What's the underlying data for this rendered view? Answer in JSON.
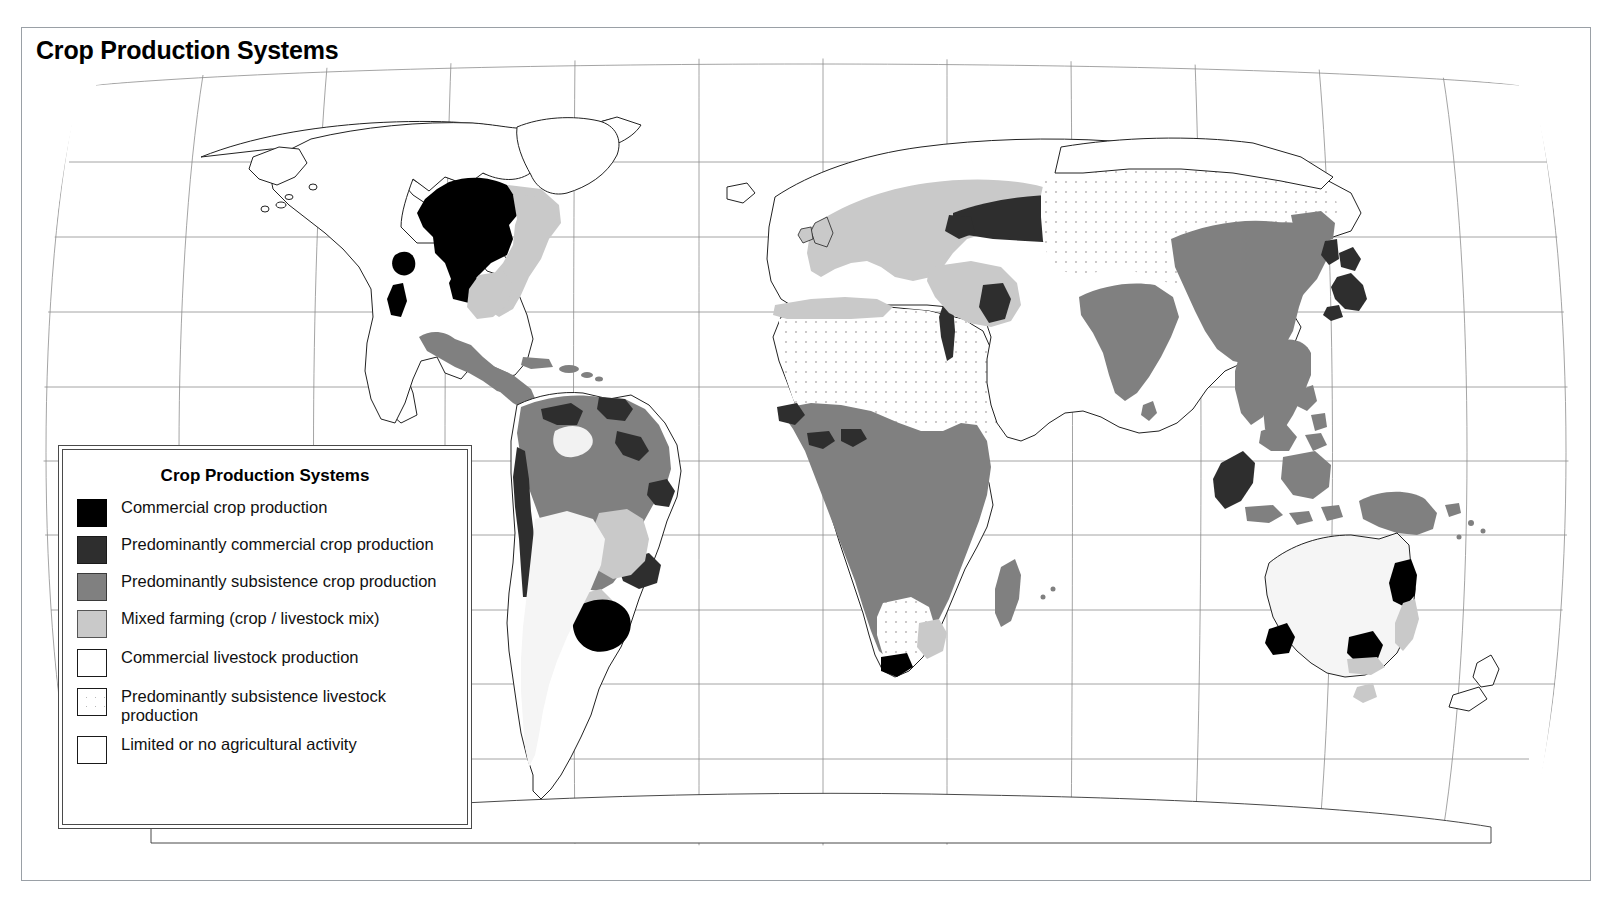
{
  "page": {
    "title": "Crop Production Systems"
  },
  "legend": {
    "title": "Crop Production Systems",
    "items": [
      {
        "swatch": "black",
        "color": "#000000",
        "label": "Commercial crop production"
      },
      {
        "swatch": "darkgray",
        "color": "#2e2e2e",
        "label": "Predominantly commercial crop production"
      },
      {
        "swatch": "midgray",
        "color": "#808080",
        "label": "Predominantly subsistence crop production"
      },
      {
        "swatch": "ltgray",
        "color": "#c9c9c9",
        "label": "Mixed farming  (crop / livestock mix)"
      },
      {
        "swatch": "white",
        "color": "#ffffff",
        "label": "Commercial livestock production"
      },
      {
        "swatch": "stipple",
        "color": "#ffffff",
        "label": "Predominantly subsistence livestock production"
      },
      {
        "swatch": "white",
        "color": "#ffffff",
        "label": "Limited or no agricultural activity"
      }
    ]
  },
  "map_data": {
    "type": "choropleth-world-map",
    "projection": "Robinson",
    "graticule": {
      "meridian_spacing_deg": 30,
      "parallel_spacing_deg": 20,
      "line_color": "#888888"
    },
    "categories": [
      "Commercial crop production",
      "Predominantly commercial crop production",
      "Predominantly subsistence crop production",
      "Mixed farming  (crop / livestock mix)",
      "Commercial livestock production",
      "Predominantly subsistence livestock production",
      "Limited or no agricultural activity"
    ],
    "regions": [
      {
        "name": "US Corn Belt / Canadian Prairies",
        "category": "Commercial crop production"
      },
      {
        "name": "California Central Valley",
        "category": "Commercial crop production"
      },
      {
        "name": "Pampas (Argentina / Uruguay)",
        "category": "Commercial crop production"
      },
      {
        "name": "South Africa Cape / Highveld",
        "category": "Commercial crop production"
      },
      {
        "name": "SE Australia / SW Australia",
        "category": "Commercial crop production"
      },
      {
        "name": "Ukraine / Black Earth belt",
        "category": "Predominantly commercial crop production"
      },
      {
        "name": "Japan / Korea",
        "category": "Predominantly commercial crop production"
      },
      {
        "name": "SE Brazil coast",
        "category": "Predominantly commercial crop production"
      },
      {
        "name": "Andes coastal strip",
        "category": "Predominantly commercial crop production"
      },
      {
        "name": "Sumatra / Malaysia",
        "category": "Predominantly commercial crop production"
      },
      {
        "name": "Nile Valley",
        "category": "Predominantly commercial crop production"
      },
      {
        "name": "Mesopotamia",
        "category": "Predominantly commercial crop production"
      },
      {
        "name": "Sub-Saharan Africa",
        "category": "Predominantly subsistence crop production"
      },
      {
        "name": "India / South Asia",
        "category": "Predominantly subsistence crop production"
      },
      {
        "name": "China / SE Asia",
        "category": "Predominantly subsistence crop production"
      },
      {
        "name": "Amazon Basin / N. South America",
        "category": "Predominantly subsistence crop production"
      },
      {
        "name": "Mexico / Central America",
        "category": "Predominantly subsistence crop production"
      },
      {
        "name": "New Guinea / Philippines / Indonesia",
        "category": "Predominantly subsistence crop production"
      },
      {
        "name": "Madagascar",
        "category": "Predominantly subsistence crop production"
      },
      {
        "name": "Europe",
        "category": "Mixed farming  (crop / livestock mix)"
      },
      {
        "name": "Eastern United States",
        "category": "Mixed farming  (crop / livestock mix)"
      },
      {
        "name": "Turkey / Levant",
        "category": "Mixed farming  (crop / livestock mix)"
      },
      {
        "name": "NW Africa (Maghreb)",
        "category": "Mixed farming  (crop / livestock mix)"
      },
      {
        "name": "Argentine Chaco / S. Brazil",
        "category": "Mixed farming  (crop / livestock mix)"
      },
      {
        "name": "Australia interior / rangelands",
        "category": "Commercial livestock production"
      },
      {
        "name": "Patagonia / Argentine plains",
        "category": "Commercial livestock production"
      },
      {
        "name": "Great Plains west",
        "category": "Commercial livestock production"
      },
      {
        "name": "New Zealand",
        "category": "Commercial livestock production"
      },
      {
        "name": "Sahara Desert",
        "category": "Predominantly subsistence livestock production"
      },
      {
        "name": "Arabian Peninsula",
        "category": "Predominantly subsistence livestock production"
      },
      {
        "name": "Central Asia / Mongolia",
        "category": "Predominantly subsistence livestock production"
      },
      {
        "name": "Kalahari / Namib",
        "category": "Predominantly subsistence livestock production"
      },
      {
        "name": "Canada North / Alaska",
        "category": "Limited or no agricultural activity"
      },
      {
        "name": "Greenland",
        "category": "Limited or no agricultural activity"
      },
      {
        "name": "Siberia North",
        "category": "Limited or no agricultural activity"
      }
    ]
  }
}
